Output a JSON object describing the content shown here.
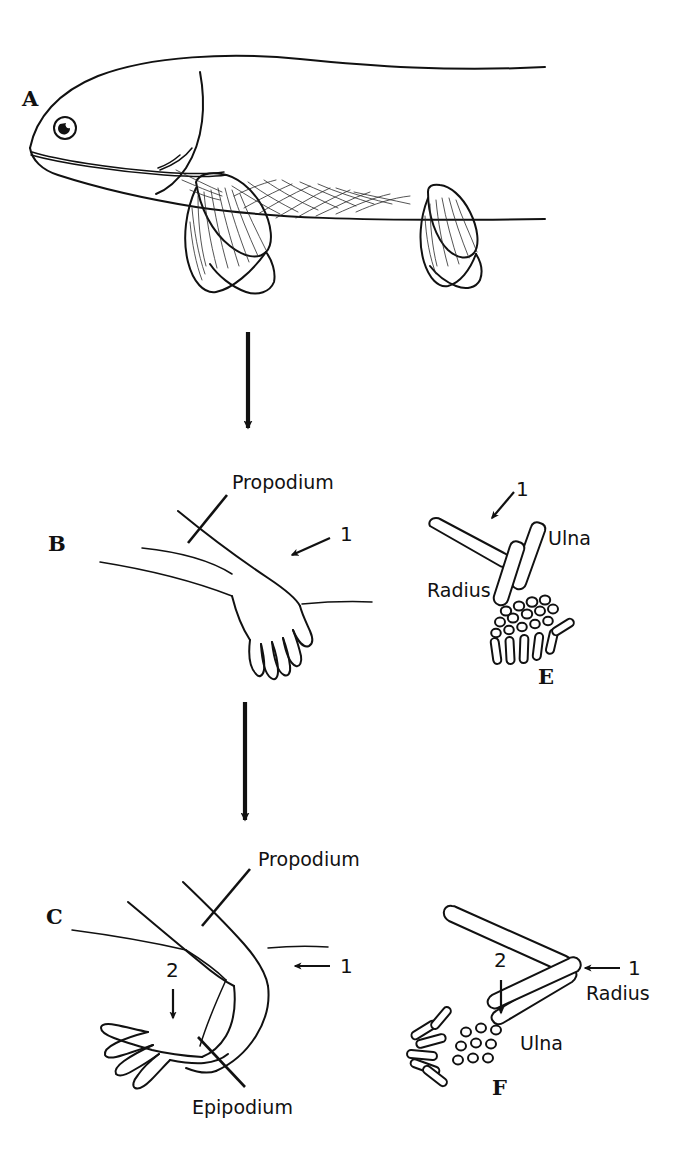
{
  "figure": {
    "background_color": "#ffffff",
    "ink_color": "#111111",
    "width": 683,
    "height": 1174
  },
  "panels": [
    {
      "id": "A",
      "letter": "A",
      "subject": "lobe-finned-fish",
      "description": "Lateral view of a lobe-finned fish with fleshy pectoral and pelvic fins"
    },
    {
      "id": "B",
      "letter": "B",
      "subject": "transitional-limb-outline",
      "description": "Outline of a transitional fin-limb in flesh"
    },
    {
      "id": "C",
      "letter": "C",
      "subject": "tetrapod-limb-outline",
      "description": "Outline of a tetrapod limb in flesh, bent at the elbow"
    },
    {
      "id": "E",
      "letter": "E",
      "subject": "transitional-limb-skeleton",
      "description": "Skeleton of the transitional fin-limb"
    },
    {
      "id": "F",
      "letter": "F",
      "subject": "tetrapod-limb-skeleton",
      "description": "Skeleton of the bent tetrapod limb"
    }
  ],
  "annotations": {
    "propodium_b": "Propodium",
    "propodium_c": "Propodium",
    "epipodium_c": "Epipodium",
    "radius_e": "Radius",
    "ulna_e": "Ulna",
    "radius_f": "Radius",
    "ulna_f": "Ulna",
    "marker_1_b": "1",
    "marker_1_c": "1",
    "marker_2_c": "2",
    "marker_1_e": "1",
    "marker_1_f": "1",
    "marker_2_f": "2"
  },
  "flow_arrows": [
    {
      "name": "arrow-a-to-b",
      "direction": "down",
      "from_panel": "A",
      "to_panel": "B"
    },
    {
      "name": "arrow-b-to-c",
      "direction": "down",
      "from_panel": "B",
      "to_panel": "C"
    }
  ]
}
